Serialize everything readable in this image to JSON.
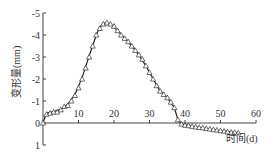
{
  "chart_data": {
    "type": "line",
    "title": "",
    "xlabel": "时间(d)",
    "ylabel": "变形量(mm)",
    "xlim": [
      0,
      60
    ],
    "ylim": [
      1,
      -5
    ],
    "y_inverted": true,
    "xticks": [
      10,
      20,
      30,
      40,
      50,
      60
    ],
    "yticks": [
      -5,
      -4,
      -3,
      -2,
      -1,
      0,
      1
    ],
    "grid": false,
    "legend": null,
    "series": [
      {
        "name": "measured",
        "marker": "triangle-open",
        "x": [
          0,
          1,
          2,
          3,
          4,
          5,
          6,
          7,
          8,
          9,
          10,
          11,
          12,
          13,
          14,
          15,
          16,
          17,
          18,
          19,
          20,
          21,
          22,
          23,
          24,
          25,
          26,
          27,
          28,
          29,
          30,
          31,
          32,
          33,
          34,
          35,
          36,
          37,
          38,
          39,
          40,
          41,
          42,
          43,
          44,
          45,
          46,
          47,
          48,
          49,
          50,
          51,
          52,
          53,
          54,
          55
        ],
        "values": [
          0,
          -0.4,
          -0.45,
          -0.5,
          -0.5,
          -0.6,
          -0.75,
          -0.8,
          -1.0,
          -1.25,
          -1.6,
          -2.0,
          -2.5,
          -3.0,
          -3.5,
          -4.0,
          -4.3,
          -4.5,
          -4.55,
          -4.5,
          -4.4,
          -4.2,
          -4.0,
          -3.85,
          -3.7,
          -3.5,
          -3.3,
          -3.1,
          -2.9,
          -2.6,
          -2.3,
          -2.0,
          -1.7,
          -1.45,
          -1.3,
          -1.15,
          -0.95,
          -0.7,
          -0.15,
          0.05,
          0.1,
          0.12,
          0.15,
          0.18,
          0.2,
          0.22,
          0.25,
          0.27,
          0.3,
          0.32,
          0.35,
          0.37,
          0.4,
          0.42,
          0.43,
          0.45
        ]
      },
      {
        "name": "fitted",
        "marker": "none",
        "x": [
          0,
          1,
          3,
          5,
          7,
          9,
          11,
          13,
          15,
          16,
          17,
          18,
          19,
          21,
          23,
          25,
          27,
          29,
          31,
          33,
          35,
          37,
          38,
          39,
          42,
          46,
          50,
          55
        ],
        "values": [
          0,
          -0.45,
          -0.52,
          -0.62,
          -0.85,
          -1.3,
          -2.05,
          -3.05,
          -4.0,
          -4.35,
          -4.52,
          -4.55,
          -4.5,
          -4.2,
          -3.85,
          -3.5,
          -3.1,
          -2.6,
          -2.0,
          -1.45,
          -1.15,
          -0.7,
          -0.15,
          0.05,
          0.15,
          0.25,
          0.35,
          0.45
        ]
      }
    ]
  }
}
